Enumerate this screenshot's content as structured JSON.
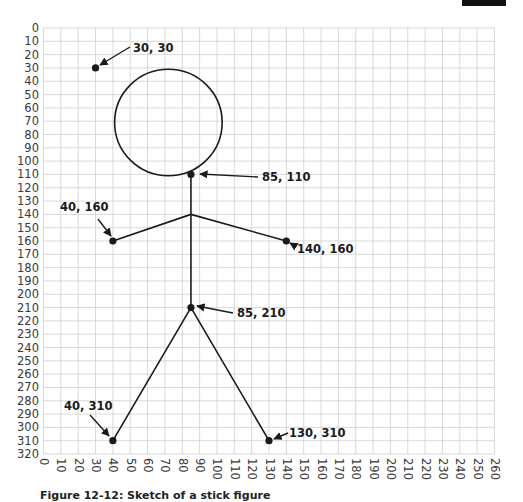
{
  "figure": {
    "caption": "Figure 12-12: Sketch of a stick figure"
  },
  "chart_data": {
    "type": "scatter",
    "title": "",
    "xlabel": "",
    "ylabel": "",
    "xlim": [
      0,
      260
    ],
    "ylim": [
      320,
      0
    ],
    "grid": true,
    "x_ticks": [
      0,
      10,
      20,
      30,
      40,
      50,
      60,
      70,
      80,
      90,
      100,
      110,
      120,
      130,
      140,
      150,
      160,
      170,
      180,
      190,
      200,
      210,
      220,
      230,
      240,
      250,
      260
    ],
    "y_ticks": [
      0,
      10,
      20,
      30,
      40,
      50,
      60,
      70,
      80,
      90,
      100,
      110,
      120,
      130,
      140,
      150,
      160,
      170,
      180,
      190,
      200,
      210,
      220,
      230,
      240,
      250,
      260,
      270,
      280,
      290,
      300,
      310,
      320
    ],
    "points": [
      {
        "x": 30,
        "y": 30,
        "label": "30, 30"
      },
      {
        "x": 85,
        "y": 110,
        "label": "85, 110"
      },
      {
        "x": 40,
        "y": 160,
        "label": "40, 160"
      },
      {
        "x": 140,
        "y": 160,
        "label": "140, 160"
      },
      {
        "x": 85,
        "y": 210,
        "label": "85, 210"
      },
      {
        "x": 40,
        "y": 310,
        "label": "40, 310"
      },
      {
        "x": 130,
        "y": 310,
        "label": "130, 310"
      }
    ],
    "shapes": {
      "head_circle": {
        "cx": 72,
        "cy": 71,
        "r_x_units": 31,
        "r_y_units": 40
      },
      "segments": [
        {
          "from": [
            85,
            110
          ],
          "to": [
            85,
            210
          ],
          "name": "torso"
        },
        {
          "from": [
            85,
            140
          ],
          "to": [
            40,
            160
          ],
          "name": "left-arm"
        },
        {
          "from": [
            85,
            140
          ],
          "to": [
            140,
            160
          ],
          "name": "right-arm"
        },
        {
          "from": [
            85,
            210
          ],
          "to": [
            40,
            310
          ],
          "name": "left-leg"
        },
        {
          "from": [
            85,
            210
          ],
          "to": [
            130,
            310
          ],
          "name": "right-leg"
        }
      ]
    }
  },
  "colors": {
    "grid": "#cfcfcf",
    "ink": "#1a1a1a",
    "axis_text": "#3a3a3a"
  }
}
